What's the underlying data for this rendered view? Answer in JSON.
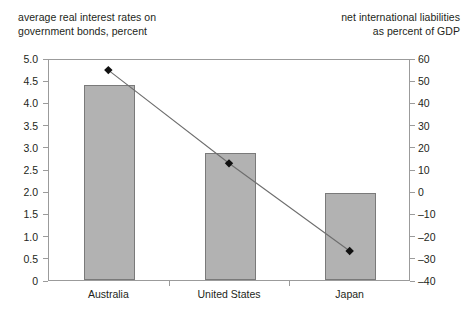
{
  "chart_data": {
    "type": "bar",
    "title": "",
    "categories": [
      "Australia",
      "United States",
      "Japan"
    ],
    "grid": false,
    "legend_position": "none",
    "series": [
      {
        "name": "average real interest rates on government bonds, percent",
        "type": "bar",
        "axis": "left",
        "values": [
          4.4,
          2.85,
          1.97
        ]
      },
      {
        "name": "net international liabilities as percent of GDP",
        "type": "line",
        "axis": "right",
        "marker": "diamond",
        "values": [
          55,
          13,
          -26.5
        ]
      }
    ],
    "left_axis": {
      "label_line1": "average real interest rates on",
      "label_line2": "government bonds, percent",
      "ylim": [
        0,
        5.0
      ],
      "tick_step": 0.5,
      "ticks": [
        "5.0",
        "4.5",
        "4.0",
        "3.5",
        "3.0",
        "2.5",
        "2.0",
        "1.5",
        "1.0",
        "0.5",
        "0"
      ]
    },
    "right_axis": {
      "label_line1": "net international liabilities",
      "label_line2": "as percent of GDP",
      "ylim": [
        -40,
        60
      ],
      "tick_step": 10,
      "ticks": [
        "60",
        "50",
        "40",
        "30",
        "20",
        "10",
        "0",
        "–10",
        "–20",
        "–30",
        "–40"
      ]
    },
    "xlabel": "",
    "colors": {
      "bar_fill": "#b2b2b2",
      "bar_stroke": "#7a7a7a",
      "line": "#6e6e6e",
      "marker": "#111111",
      "axis": "#9b9b9b",
      "text": "#231f20",
      "background": "#ffffff"
    }
  }
}
